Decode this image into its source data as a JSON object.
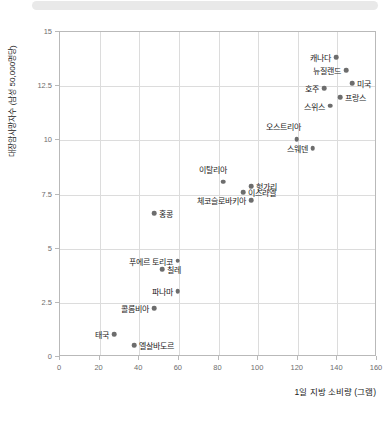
{
  "chart_data": {
    "type": "scatter",
    "title": "",
    "xlabel": "1일 지방 소비량 (그램)",
    "ylabel": "대장암사망자수 (남성 50,000명당)",
    "xlim": [
      0,
      160
    ],
    "ylim": [
      0,
      15
    ],
    "xticks": [
      0,
      20,
      40,
      60,
      80,
      100,
      120,
      140,
      160
    ],
    "xtick_labels": [
      "0",
      "20",
      "40",
      "60",
      "80",
      "100",
      "120",
      "140",
      "160"
    ],
    "yticks": [
      0,
      2.5,
      5,
      7.5,
      10,
      12.5,
      15
    ],
    "ytick_labels": [
      "0",
      "2.5",
      "5",
      "7.5",
      "10",
      "12.5",
      "15"
    ],
    "grid": true,
    "legend": null,
    "marker_color": "#6d6d6d",
    "grid_color": "#dcdcdc",
    "axis_color": "#b9b9b9",
    "points": [
      {
        "label": "캐나다",
        "x": 140,
        "y": 13.8,
        "label_side": "left"
      },
      {
        "label": "뉴질랜드",
        "x": 145,
        "y": 13.2,
        "label_side": "left"
      },
      {
        "label": "미국",
        "x": 148,
        "y": 12.6,
        "label_side": "right"
      },
      {
        "label": "호주",
        "x": 134,
        "y": 12.35,
        "label_side": "left"
      },
      {
        "label": "프랑스",
        "x": 142,
        "y": 11.95,
        "label_side": "right"
      },
      {
        "label": "스위스",
        "x": 137,
        "y": 11.55,
        "label_side": "left"
      },
      {
        "label": "오스트리아",
        "x": 120,
        "y": 10.0,
        "label_side": "above"
      },
      {
        "label": "스웨덴",
        "x": 128,
        "y": 9.6,
        "label_side": "left"
      },
      {
        "label": "이탈리아",
        "x": 83,
        "y": 8.05,
        "label_side": "above"
      },
      {
        "label": "헝가리",
        "x": 97,
        "y": 7.85,
        "label_side": "right"
      },
      {
        "label": "이스라엘",
        "x": 93,
        "y": 7.55,
        "label_side": "right"
      },
      {
        "label": "체코슬로바키아",
        "x": 97,
        "y": 7.2,
        "label_side": "left"
      },
      {
        "label": "홍콩",
        "x": 48,
        "y": 6.6,
        "label_side": "right"
      },
      {
        "label": "푸에르 토리코",
        "x": 60,
        "y": 4.4,
        "label_side": "left"
      },
      {
        "label": "칠레",
        "x": 52,
        "y": 4.0,
        "label_side": "right"
      },
      {
        "label": "파나마",
        "x": 60,
        "y": 3.0,
        "label_side": "left"
      },
      {
        "label": "콜롬비아",
        "x": 48,
        "y": 2.2,
        "label_side": "left"
      },
      {
        "label": "태국",
        "x": 28,
        "y": 1.0,
        "label_side": "left"
      },
      {
        "label": "엘살바도르",
        "x": 38,
        "y": 0.5,
        "label_side": "right"
      }
    ]
  }
}
